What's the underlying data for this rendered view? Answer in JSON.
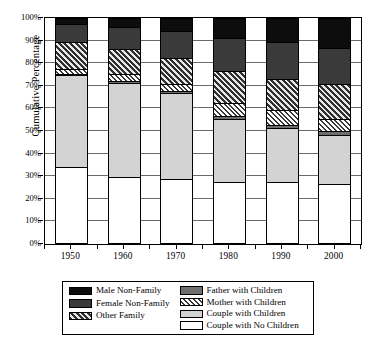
{
  "chart_data": {
    "type": "bar",
    "title": "",
    "subtitle": "",
    "xlabel": "",
    "ylabel": "Cumulative Percentage",
    "categories": [
      "1950",
      "1960",
      "1970",
      "1980",
      "1990",
      "2000"
    ],
    "ylim": [
      0,
      100
    ],
    "ytick_labels": [
      "0%",
      "10%",
      "20%",
      "30%",
      "40%",
      "50%",
      "60%",
      "70%",
      "80%",
      "90%",
      "100%"
    ],
    "ytick_values": [
      0,
      10,
      20,
      30,
      40,
      50,
      60,
      70,
      80,
      90,
      100
    ],
    "grid": true,
    "stacked": true,
    "stack_order_bottom_to_top": [
      "Couple with No Children",
      "Couple with Children",
      "Father with Children",
      "Mother with Children",
      "Other Family",
      "Female Non-Family",
      "Male Non-Family"
    ],
    "legend_position": "bottom",
    "series": [
      {
        "name": "Couple with No Children",
        "fill": "white",
        "color": "#ffffff",
        "values": [
          33.5,
          29.0,
          28.5,
          27.0,
          27.0,
          26.0
        ],
        "cumulative": [
          33.5,
          29.0,
          28.5,
          27.0,
          27.0,
          26.0
        ]
      },
      {
        "name": "Couple with Children",
        "fill": "lightgray",
        "color": "#d3d3d3",
        "values": [
          41.0,
          42.0,
          38.0,
          28.0,
          24.0,
          22.0
        ],
        "cumulative": [
          74.5,
          71.0,
          66.5,
          55.0,
          51.0,
          48.0
        ]
      },
      {
        "name": "Father with Children",
        "fill": "midgray",
        "color": "#6e6e6e",
        "values": [
          0.5,
          0.7,
          0.6,
          1.0,
          1.3,
          1.6
        ],
        "cumulative": [
          75.0,
          71.7,
          67.1,
          56.0,
          52.3,
          49.6
        ]
      },
      {
        "name": "Mother with Children",
        "fill": "lighthatch",
        "color": "#ffffff",
        "values": [
          2.0,
          3.3,
          3.4,
          6.0,
          6.7,
          5.4
        ],
        "cumulative": [
          77.0,
          75.0,
          70.5,
          62.0,
          59.0,
          55.0
        ]
      },
      {
        "name": "Other Family",
        "fill": "darkhatch",
        "color": "#2f2f2f",
        "values": [
          12.0,
          11.0,
          11.5,
          14.0,
          13.5,
          15.5
        ],
        "cumulative": [
          89.0,
          86.0,
          82.0,
          76.0,
          72.5,
          70.5
        ]
      },
      {
        "name": "Female Non-Family",
        "fill": "darkgray",
        "color": "#3a3a3a",
        "values": [
          8.0,
          9.5,
          12.0,
          14.5,
          16.5,
          16.0
        ],
        "cumulative": [
          97.0,
          95.5,
          94.0,
          90.5,
          89.0,
          86.5
        ]
      },
      {
        "name": "Male Non-Family",
        "fill": "black",
        "color": "#0d0d0d",
        "values": [
          3.0,
          4.5,
          6.0,
          9.5,
          11.0,
          13.5
        ],
        "cumulative": [
          100.0,
          100.0,
          100.0,
          100.0,
          100.0,
          100.0
        ]
      }
    ]
  },
  "legend": {
    "left_column": [
      {
        "label": "Male Non-Family",
        "fill": "black"
      },
      {
        "label": "Female Non-Family",
        "fill": "darkgray"
      },
      {
        "label": "Other Family",
        "fill": "darkhatch"
      }
    ],
    "right_column": [
      {
        "label": "Father with Children",
        "fill": "midgray"
      },
      {
        "label": "Mother with Children",
        "fill": "lighthatch"
      },
      {
        "label": "Couple with Children",
        "fill": "lightgray"
      },
      {
        "label": "Couple with No Children",
        "fill": "white"
      }
    ]
  }
}
